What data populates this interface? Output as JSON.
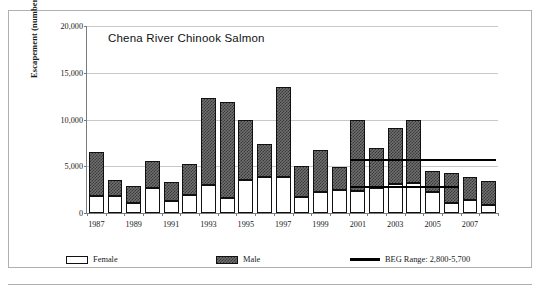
{
  "chart_data": {
    "type": "bar",
    "title": "Chena River Chinook Salmon",
    "xlabel": "",
    "ylabel": "Escapement (number of fish",
    "ylim": [
      0,
      20000
    ],
    "ytick_labels": [
      "0",
      "5,000",
      "10,000",
      "15,000",
      "20,000"
    ],
    "ytick_values": [
      0,
      5000,
      10000,
      15000,
      20000
    ],
    "grid": true,
    "stacked": true,
    "legend_position": "bottom",
    "categories": [
      "1987",
      "1988",
      "1989",
      "1990",
      "1991",
      "1992",
      "1993",
      "1994",
      "1995",
      "1996",
      "1997",
      "1998",
      "1999",
      "2000",
      "2001",
      "2002",
      "2003",
      "2004",
      "2005",
      "2006",
      "2007",
      "2008"
    ],
    "xtick_labels": [
      "1987",
      "1989",
      "1991",
      "1993",
      "1995",
      "1997",
      "1999",
      "2001",
      "2003",
      "2005",
      "2007"
    ],
    "series": [
      {
        "name": "Female",
        "values": [
          1800,
          1800,
          1100,
          2700,
          1300,
          1900,
          3000,
          1600,
          3500,
          3900,
          3800,
          1700,
          2300,
          2500,
          2400,
          2700,
          3100,
          3200,
          2300,
          1100,
          1400,
          900
        ]
      },
      {
        "name": "Male",
        "values": [
          4700,
          1700,
          1800,
          2900,
          2000,
          3300,
          9300,
          10300,
          6400,
          3500,
          9700,
          3300,
          4400,
          2400,
          7600,
          4300,
          6000,
          6800,
          2200,
          3200,
          2500,
          2500
        ]
      }
    ],
    "totals": [
      6500,
      3500,
      2900,
      5600,
      3300,
      5200,
      12300,
      11900,
      9900,
      7400,
      13500,
      5000,
      6700,
      4900,
      10000,
      7000,
      9100,
      10000,
      4500,
      4300,
      3900,
      3400
    ],
    "annotations": [
      {
        "name": "beg-upper-line",
        "label": "BEG upper bound",
        "value": 5700,
        "x_start_category": "2001",
        "x_end_category": "2008"
      },
      {
        "name": "beg-lower-line",
        "label": "BEG lower bound",
        "value": 2800,
        "x_start_category": "2001",
        "x_end_category": "2006"
      }
    ]
  },
  "legend": {
    "items": [
      {
        "label": "Female",
        "swatch": "female-pattern-swatch"
      },
      {
        "label": "Male",
        "swatch": "male-pattern-swatch"
      },
      {
        "label": "BEG Range: 2,800-5,700",
        "swatch": "beg-line-swatch"
      }
    ]
  }
}
